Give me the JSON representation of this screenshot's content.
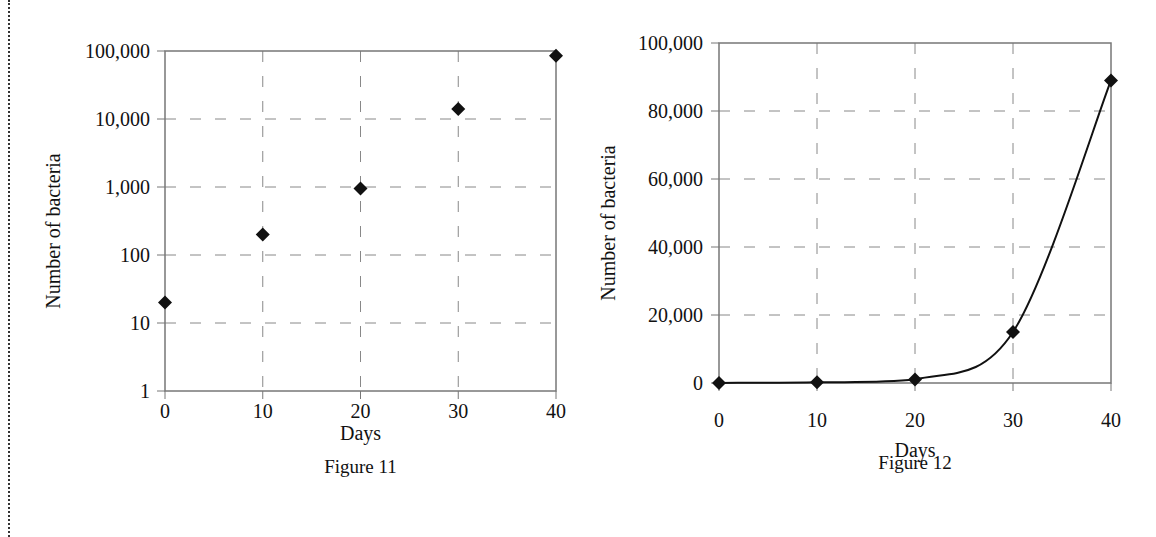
{
  "figures": [
    {
      "caption": "Figure 11",
      "xlabel": "Days",
      "ylabel": "Number of bacteria",
      "x_ticks": [
        "0",
        "10",
        "20",
        "30",
        "40"
      ],
      "y_ticks": [
        "1",
        "10",
        "100",
        "1,000",
        "10,000",
        "100,000"
      ]
    },
    {
      "caption": "Figure 12",
      "xlabel": "Days",
      "ylabel": "Number of bacteria",
      "x_ticks": [
        "0",
        "10",
        "20",
        "30",
        "40"
      ],
      "y_ticks": [
        "0",
        "20,000",
        "40,000",
        "60,000",
        "80,000",
        "100,000"
      ]
    }
  ],
  "chart_data": [
    {
      "type": "scatter",
      "title": "Figure 11",
      "xlabel": "Days",
      "ylabel": "Number of bacteria",
      "yscale": "log",
      "x": [
        0,
        10,
        20,
        30,
        40
      ],
      "series": [
        {
          "name": "Number of bacteria",
          "values": [
            20,
            200,
            950,
            14000,
            85000
          ],
          "marker": "diamond"
        }
      ],
      "xlim": [
        0,
        40
      ],
      "ylim": [
        1,
        100000
      ],
      "x_ticks": [
        0,
        10,
        20,
        30,
        40
      ],
      "y_ticks": [
        1,
        10,
        100,
        1000,
        10000,
        100000
      ],
      "grid": "dashed",
      "legend": "none"
    },
    {
      "type": "line",
      "title": "Figure 12",
      "xlabel": "Days",
      "ylabel": "Number of bacteria",
      "yscale": "linear",
      "x": [
        0,
        10,
        20,
        30,
        40
      ],
      "series": [
        {
          "name": "Number of bacteria",
          "values": [
            20,
            200,
            1000,
            15000,
            89000
          ],
          "marker": "diamond",
          "smoothed": true
        }
      ],
      "xlim": [
        0,
        40
      ],
      "ylim": [
        0,
        100000
      ],
      "x_ticks": [
        0,
        10,
        20,
        30,
        40
      ],
      "y_ticks": [
        0,
        20000,
        40000,
        60000,
        80000,
        100000
      ],
      "grid": "dashed",
      "legend": "none"
    }
  ]
}
